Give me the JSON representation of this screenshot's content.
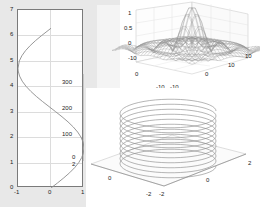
{
  "figure": {
    "background_color": "#e8e8e8",
    "axes_background": "#ffffff",
    "line_color": "#8c8c8c",
    "grid_color": "#dcdcdc",
    "axis_color": "#6d6d6d"
  },
  "chart_data": [
    {
      "id": "sine-parametric-plot",
      "type": "line",
      "title": "",
      "xlabel": "",
      "ylabel": "",
      "xlim": [
        -1,
        1
      ],
      "ylim": [
        0,
        7
      ],
      "grid": true,
      "xticks": [
        "-1",
        "0",
        "1"
      ],
      "xtick_values": [
        -1,
        0,
        1
      ],
      "yticks": [
        "0",
        "1",
        "2",
        "3",
        "4",
        "5",
        "6",
        "7"
      ],
      "ytick_values": [
        0,
        1,
        2,
        3,
        4,
        5,
        6,
        7
      ],
      "description": "x = sin(t) plotted against t on vertical axis, t from 0 to 6.283",
      "series": [
        {
          "name": "sin(t)",
          "t": [
            0,
            0.2,
            0.4,
            0.6,
            0.8,
            1.0,
            1.2,
            1.4,
            1.571,
            1.8,
            2.0,
            2.2,
            2.4,
            2.6,
            2.8,
            3.0,
            3.1416,
            3.4,
            3.6,
            3.8,
            4.0,
            4.2,
            4.4,
            4.6,
            4.712,
            5.0,
            5.2,
            5.4,
            5.6,
            5.8,
            6.0,
            6.283
          ],
          "x": [
            0.0,
            0.199,
            0.389,
            0.565,
            0.717,
            0.841,
            0.932,
            0.985,
            1.0,
            0.974,
            0.909,
            0.808,
            0.675,
            0.516,
            0.335,
            0.141,
            0.0,
            -0.256,
            -0.443,
            -0.612,
            -0.757,
            -0.872,
            -0.952,
            -0.994,
            -1.0,
            -0.959,
            -0.883,
            -0.773,
            -0.631,
            -0.465,
            -0.279,
            0.0
          ]
        }
      ]
    },
    {
      "id": "surface-plot",
      "type": "surface",
      "title": "",
      "xlabel": "",
      "ylabel": "",
      "zlabel": "",
      "xticks": [
        "-10",
        "0",
        "10"
      ],
      "yticks": [
        "-10",
        "0",
        "10"
      ],
      "zticks": [
        "0",
        "0.5",
        "1"
      ],
      "xlim": [
        -10,
        10
      ],
      "ylim": [
        -10,
        10
      ],
      "zlim": [
        0,
        1
      ],
      "grid": true,
      "description": "3D mesh surface resembling sinc / sombrero function peaking at center with value 1"
    },
    {
      "id": "helix-plot",
      "type": "line3d",
      "title": "",
      "xlabel": "",
      "ylabel": "",
      "zlabel": "",
      "xticks": [
        "-2",
        "0",
        "2"
      ],
      "yticks": [
        "-2",
        "0",
        "2"
      ],
      "zticks": [
        "0",
        "100",
        "200",
        "300"
      ],
      "xlim": [
        -2,
        2
      ],
      "ylim": [
        -2,
        2
      ],
      "zlim": [
        0,
        300
      ],
      "grid": false,
      "turns": 11,
      "description": "3D helix / spiral curve forming a cylinder, radius ~2, rising from z=0 to z=300"
    }
  ],
  "labels": {
    "left_plot": {
      "y": [
        "7",
        "6",
        "5",
        "4",
        "3",
        "2",
        "1",
        "0"
      ],
      "x": [
        "-1",
        "0",
        "1"
      ]
    },
    "surface_plot": {
      "z": [
        "1",
        "0.5",
        "0"
      ],
      "x_left": "-10",
      "x_mid_left": "0",
      "x_bottom_left": "-10",
      "x_bottom_right": "-10",
      "y_mid_right": "0",
      "y_right": "10",
      "y_top_right": "10"
    },
    "helix_plot": {
      "z": [
        "300",
        "200",
        "100",
        "0"
      ],
      "x_left": "0",
      "x_corner_left": "-2",
      "x_corner_right": "-2",
      "y_mid_right": "0",
      "y_right": "2",
      "z_corner": "2"
    }
  }
}
